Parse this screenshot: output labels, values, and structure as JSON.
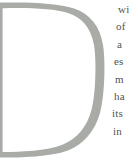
{
  "article": {
    "drop_cap": "D",
    "drop_cap_color": "#a9aba7",
    "text_color": "#54544f",
    "lines": [
      "wi",
      "of",
      "a",
      "es",
      "m",
      "ha",
      "its",
      "in"
    ]
  }
}
